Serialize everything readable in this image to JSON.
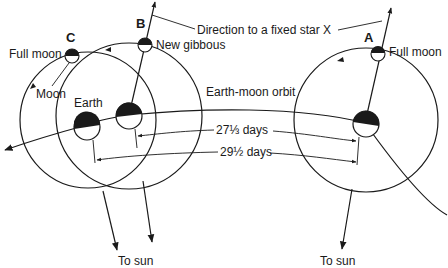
{
  "diagram": {
    "type": "sidereal-vs-synodic-month",
    "positions": [
      {
        "id": "A",
        "label": "A",
        "moon_label": "Full moon"
      },
      {
        "id": "B",
        "label": "B",
        "moon_label": "New gibbous"
      },
      {
        "id": "C",
        "label": "C",
        "moon_label": "Full moon"
      }
    ],
    "labels": {
      "fixed_star": "Direction to a fixed star X",
      "orbit": "Earth-moon orbit",
      "moon": "Moon",
      "earth": "Earth",
      "sidereal": "27⅓ days",
      "synodic": "29½ days",
      "to_sun_left": "To sun",
      "to_sun_right": "To sun"
    },
    "colors": {
      "ink": "#1a1a1a",
      "background": "#ffffff"
    }
  }
}
